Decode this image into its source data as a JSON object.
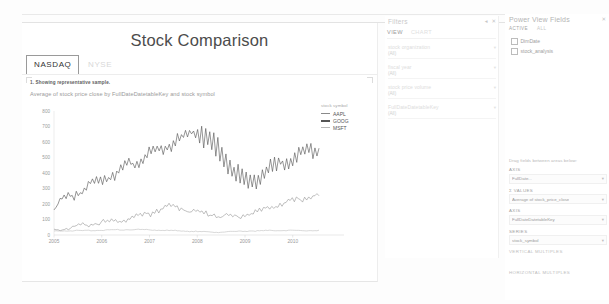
{
  "report": {
    "title": "Stock Comparison",
    "tabs": [
      {
        "label": "NASDAQ",
        "active": true
      },
      {
        "label": "NYSE",
        "active": false
      }
    ]
  },
  "chart": {
    "note": "1. Showing representative sample.",
    "subtitle": "Average of stock price close by FullDateDatetableKey and stock symbol",
    "legend_title": "stock symbol"
  },
  "chart_data": {
    "type": "line",
    "title": "Average of stock price close by FullDateDatetableKey and stock symbol",
    "xlabel": "FullDateDatetableKey",
    "ylabel": "Average of stock price close",
    "xlim": [
      2005,
      2010.6
    ],
    "ylim": [
      0,
      800
    ],
    "yticks": [
      0,
      100,
      200,
      300,
      400,
      500,
      600,
      700,
      800
    ],
    "xticks": [
      "2005",
      "2006",
      "2007",
      "2008",
      "2009",
      "2010"
    ],
    "grid": false,
    "legend_position": "top-right",
    "series": [
      {
        "name": "AAPL",
        "color": "#8a8a8a",
        "values": [
          35,
          38,
          41,
          36,
          44,
          38,
          46,
          42,
          50,
          48,
          56,
          52,
          62,
          58,
          66,
          60,
          72,
          64,
          70,
          68,
          76,
          72,
          80,
          74,
          86,
          78,
          84,
          82,
          90,
          86,
          94,
          88,
          98,
          92,
          104,
          96,
          110,
          102,
          118,
          108,
          124,
          112,
          130,
          120,
          138,
          126,
          146,
          132,
          158,
          140,
          168,
          150,
          178,
          160,
          190,
          170,
          200,
          178,
          188,
          172,
          180,
          168,
          176,
          162,
          170,
          155,
          162,
          150,
          158,
          146,
          152,
          140,
          148,
          136,
          144,
          132,
          140,
          128,
          136,
          124,
          132,
          120,
          128,
          118,
          126,
          116,
          124,
          115,
          122,
          114,
          126,
          118,
          132,
          124,
          140,
          130,
          148,
          138,
          156,
          144,
          164,
          152,
          172,
          160,
          180,
          168,
          190,
          176,
          198,
          184,
          206,
          192,
          214,
          200,
          220,
          208,
          226,
          214,
          232,
          220,
          238,
          226,
          244,
          232,
          250,
          238,
          256,
          244,
          262,
          250
        ]
      },
      {
        "name": "GOOG",
        "color": "#555555",
        "values": [
          195,
          210,
          188,
          225,
          200,
          240,
          215,
          255,
          230,
          270,
          245,
          285,
          260,
          300,
          275,
          315,
          290,
          330,
          300,
          345,
          315,
          360,
          330,
          372,
          345,
          388,
          358,
          400,
          372,
          412,
          385,
          425,
          398,
          440,
          412,
          455,
          425,
          468,
          440,
          482,
          452,
          495,
          465,
          508,
          478,
          520,
          490,
          535,
          502,
          548,
          515,
          560,
          528,
          572,
          540,
          585,
          552,
          598,
          565,
          612,
          578,
          625,
          590,
          638,
          602,
          652,
          615,
          665,
          628,
          678,
          640,
          692,
          600,
          705,
          585,
          690,
          560,
          660,
          530,
          630,
          500,
          600,
          470,
          565,
          440,
          530,
          410,
          495,
          380,
          460,
          355,
          430,
          330,
          405,
          310,
          385,
          300,
          372,
          312,
          390,
          330,
          408,
          348,
          425,
          365,
          442,
          382,
          458,
          398,
          472,
          412,
          488,
          428,
          500,
          442,
          512,
          455,
          525,
          468,
          538,
          480,
          548,
          492,
          558,
          502,
          568,
          512,
          578,
          522,
          585,
          530,
          592
        ]
      },
      {
        "name": "MSFT",
        "color": "#b8b8b8",
        "values": [
          25,
          26,
          25,
          27,
          26,
          27,
          26,
          28,
          27,
          28,
          27,
          29,
          28,
          29,
          28,
          30,
          29,
          30,
          29,
          31,
          30,
          31,
          30,
          32,
          31,
          32,
          31,
          33,
          32,
          33,
          32,
          34,
          33,
          34,
          33,
          35,
          34,
          35,
          34,
          36,
          35,
          36,
          35,
          36,
          34,
          35,
          33,
          34,
          32,
          33,
          31,
          32,
          30,
          31,
          29,
          30,
          28,
          29,
          27,
          28,
          26,
          27,
          25,
          26,
          24,
          25,
          23,
          24,
          22,
          23,
          21,
          22,
          20,
          21,
          19,
          20,
          18,
          19,
          18,
          19,
          18,
          19,
          19,
          20,
          20,
          21,
          21,
          22,
          22,
          23,
          23,
          24,
          24,
          25,
          25,
          26,
          26,
          27,
          26,
          27,
          27,
          28,
          27,
          28,
          28,
          29,
          28,
          29,
          29,
          30,
          29,
          30,
          29,
          30,
          29,
          30,
          29,
          30,
          28,
          29,
          28,
          29,
          28,
          29,
          28,
          29,
          28,
          29,
          28,
          29
        ]
      }
    ]
  },
  "filters": {
    "title": "Filters",
    "icons": {
      "collapse": "◂",
      "close": "✕"
    },
    "tabs": [
      {
        "label": "VIEW",
        "active": true
      },
      {
        "label": "CHART",
        "active": false
      }
    ],
    "items": [
      {
        "name": "stock organization",
        "value": "(All)"
      },
      {
        "name": "fiscal year",
        "value": "(All)"
      },
      {
        "name": "stock price volume",
        "value": "(All)"
      },
      {
        "name": "FullDateDatetableKey",
        "value": "(All)"
      }
    ]
  },
  "fields": {
    "title": "Power View Fields",
    "close_icon": "✕",
    "tabs": [
      {
        "label": "ACTIVE",
        "active": true
      },
      {
        "label": "ALL",
        "active": false
      }
    ],
    "tables": [
      {
        "label": "DimDate",
        "checked": false
      },
      {
        "label": "stock_analysis",
        "checked": false
      }
    ],
    "wells_hint": "Drag fields between areas below:",
    "wells": [
      {
        "title": "AXIS",
        "pill": "FullDate...",
        "chevron": "▾",
        "sigma": false
      },
      {
        "title": "Σ VALUES",
        "pill": "Average of stock_price_close",
        "chevron": "▾",
        "sigma": true
      },
      {
        "title": "AXIS",
        "pill": "FullDateDatetableKey",
        "chevron": "▾",
        "sigma": false
      },
      {
        "title": "SERIES",
        "pill": "stock_symbol",
        "chevron": "▾",
        "sigma": false
      }
    ],
    "empty_wells": [
      "VERTICAL MULTIPLES",
      "HORIZONTAL MULTIPLES"
    ]
  }
}
